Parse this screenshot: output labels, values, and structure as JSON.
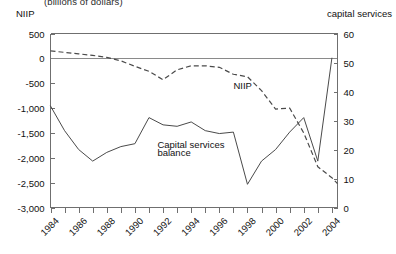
{
  "header": {
    "subtitle": "(billions of dollars)",
    "left_axis_title": "NIIP",
    "right_axis_title": "capital services"
  },
  "annotations": {
    "niip_label": "NIIP",
    "balance_label_line1": "Capital services",
    "balance_label_line2": "balance"
  },
  "chart_data": {
    "type": "line",
    "title": "(billions of dollars)",
    "xlabel": "",
    "ylabel": "NIIP",
    "y2label": "capital services",
    "ylim": [
      -3000,
      500
    ],
    "y2lim": [
      0,
      60
    ],
    "xlim": [
      1984,
      2004.4
    ],
    "grid": false,
    "legend": "inline-annotations",
    "yticks": [
      "500",
      "0",
      "-500",
      "-1,000",
      "-1,500",
      "-2,000",
      "-2,500",
      "-3,000"
    ],
    "ytick_values": [
      500,
      0,
      -500,
      -1000,
      -1500,
      -2000,
      -2500,
      -3000
    ],
    "y2ticks": [
      "60",
      "50",
      "40",
      "30",
      "20",
      "10",
      "0"
    ],
    "y2tick_values": [
      60,
      50,
      40,
      30,
      20,
      10,
      0
    ],
    "xticks": [
      "1984",
      "1986",
      "1988",
      "1990",
      "1992",
      "1994",
      "1996",
      "1998",
      "2000",
      "2002",
      "2004"
    ],
    "xtick_values": [
      1984,
      1986,
      1988,
      1990,
      1992,
      1994,
      1996,
      1998,
      2000,
      2002,
      2004
    ],
    "minor_xtick_values": [
      1985,
      1987,
      1989,
      1991,
      1993,
      1995,
      1997,
      1999,
      2001,
      2003
    ],
    "x": [
      1984,
      1985,
      1986,
      1987,
      1988,
      1989,
      1990,
      1991,
      1992,
      1993,
      1994,
      1995,
      1996,
      1997,
      1998,
      1999,
      2000,
      2001,
      2002,
      2003,
      2004,
      2004.4
    ],
    "series": [
      {
        "name": "NIIP",
        "axis": "left",
        "style": "dashed",
        "color": "#4a4a4a",
        "x": [
          1984,
          1985,
          1986,
          1987,
          1988,
          1989,
          1990,
          1991,
          1992,
          1993,
          1994,
          1995,
          1996,
          1997,
          1998,
          1999,
          2000,
          2001,
          2002,
          2003,
          2004,
          2004.4
        ],
        "values": [
          150,
          120,
          90,
          60,
          20,
          -50,
          -160,
          -260,
          -430,
          -230,
          -150,
          -150,
          -180,
          -320,
          -370,
          -650,
          -1020,
          -1000,
          -1500,
          -2180,
          -2400,
          -2520
        ]
      },
      {
        "name": "Capital services balance",
        "axis": "right",
        "style": "solid",
        "color": "#4a4a4a",
        "x": [
          1984,
          1985,
          1986,
          1987,
          1988,
          1989,
          1990,
          1991,
          1992,
          1993,
          1994,
          1995,
          1996,
          1997,
          1998,
          1999,
          2000,
          2001,
          2002,
          2003,
          2004
        ],
        "values": [
          35.0,
          26.5,
          20.0,
          16.0,
          19.0,
          21.0,
          22.0,
          31.0,
          28.5,
          28.0,
          29.5,
          26.5,
          25.5,
          26.0,
          8.0,
          16.0,
          20.0,
          26.0,
          31.0,
          16.0,
          51.5
        ]
      }
    ],
    "annotations": [
      {
        "text": "NIIP",
        "x": 1997.0,
        "y_axis": "left",
        "y": -620
      },
      {
        "text": "Capital services",
        "x": 1991.6,
        "y_axis": "left",
        "y": -1800
      },
      {
        "text": "balance",
        "x": 1991.6,
        "y_axis": "left",
        "y": -1960
      }
    ]
  }
}
